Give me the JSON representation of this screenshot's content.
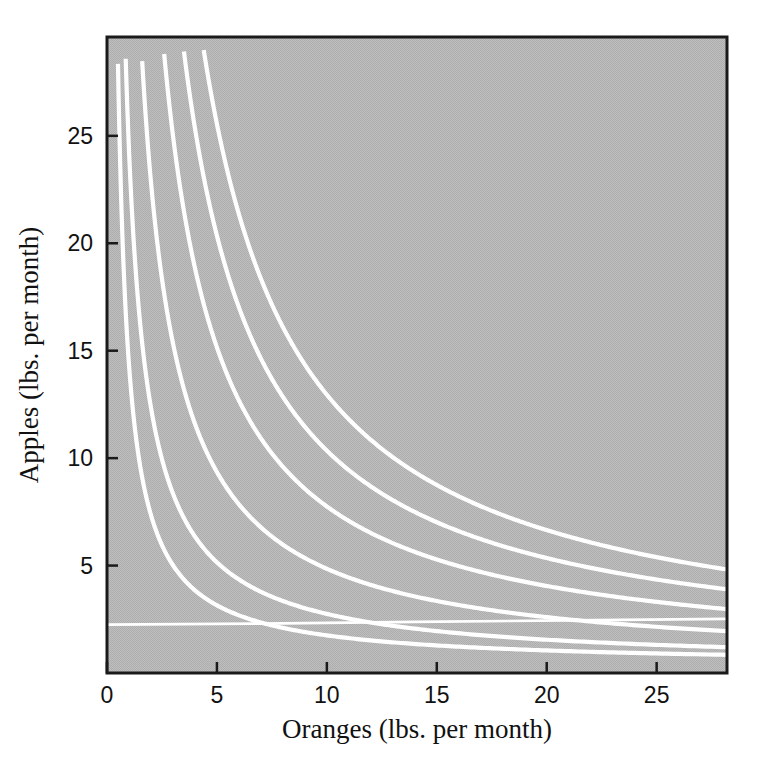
{
  "figure": {
    "background_color": "#ffffff",
    "plot_background_color": "#b6b6b6",
    "curve_color": "#ffffff",
    "axis_color": "#1a1a1a"
  },
  "chart_data": {
    "type": "line",
    "title": "",
    "subtitle": "",
    "xlabel": "Oranges (lbs. per month)",
    "ylabel": "Apples (lbs. per month)",
    "xlim": [
      0,
      28.2
    ],
    "ylim": [
      0,
      29.6
    ],
    "xticks": [
      0,
      5,
      10,
      15,
      20,
      25
    ],
    "xticklabels": [
      "0",
      "5",
      "10",
      "15",
      "20",
      "25"
    ],
    "yticks": [
      5,
      10,
      15,
      20,
      25
    ],
    "yticklabels": [
      "5",
      "10",
      "15",
      "20",
      "25"
    ],
    "grid": false,
    "legend": "none",
    "annotations": [],
    "series": [
      {
        "name": "indifference-curve-1",
        "k": 14.0,
        "asymptote": 0.35,
        "x_start": 0.5,
        "x_end": 28.2,
        "points": [
          [
            0.5,
            28.4
          ],
          [
            1.0,
            14.3
          ],
          [
            1.5,
            9.7
          ],
          [
            2.0,
            7.4
          ],
          [
            3.0,
            5.0
          ],
          [
            4.0,
            3.9
          ],
          [
            5.0,
            3.2
          ],
          [
            7.0,
            2.4
          ],
          [
            10.0,
            1.8
          ],
          [
            13.0,
            1.4
          ],
          [
            16.0,
            1.2
          ],
          [
            20.0,
            1.0
          ],
          [
            24.0,
            0.9
          ],
          [
            28.2,
            0.85
          ]
        ]
      },
      {
        "name": "indifference-curve-2",
        "k": 24.0,
        "asymptote": 0.35,
        "x_start": 0.85,
        "x_end": 28.2,
        "points": [
          [
            0.85,
            28.4
          ],
          [
            1.5,
            16.4
          ],
          [
            2.0,
            12.4
          ],
          [
            3.0,
            8.4
          ],
          [
            4.0,
            6.4
          ],
          [
            5.0,
            5.2
          ],
          [
            7.0,
            3.8
          ],
          [
            10.0,
            2.8
          ],
          [
            13.0,
            2.2
          ],
          [
            16.0,
            1.9
          ],
          [
            20.0,
            1.6
          ],
          [
            24.0,
            1.4
          ],
          [
            28.2,
            1.2
          ]
        ]
      },
      {
        "name": "indifference-curve-3",
        "k": 45.0,
        "asymptote": 0.35,
        "x_start": 1.6,
        "x_end": 28.2,
        "points": [
          [
            1.6,
            28.5
          ],
          [
            2.0,
            22.9
          ],
          [
            3.0,
            15.4
          ],
          [
            4.0,
            11.6
          ],
          [
            5.0,
            9.4
          ],
          [
            7.0,
            6.8
          ],
          [
            10.0,
            4.9
          ],
          [
            13.0,
            3.8
          ],
          [
            16.0,
            3.2
          ],
          [
            20.0,
            2.6
          ],
          [
            24.0,
            2.2
          ],
          [
            28.2,
            1.95
          ]
        ]
      },
      {
        "name": "indifference-curve-4",
        "k": 74.0,
        "asymptote": 0.35,
        "x_start": 2.6,
        "x_end": 28.2,
        "points": [
          [
            2.6,
            28.8
          ],
          [
            3.0,
            25.0
          ],
          [
            4.0,
            18.9
          ],
          [
            5.0,
            15.2
          ],
          [
            7.0,
            10.9
          ],
          [
            10.0,
            7.8
          ],
          [
            13.0,
            6.0
          ],
          [
            16.0,
            5.0
          ],
          [
            20.0,
            4.05
          ],
          [
            24.0,
            3.4
          ],
          [
            28.2,
            3.0
          ]
        ]
      },
      {
        "name": "indifference-curve-5",
        "k": 100.0,
        "asymptote": 0.35,
        "x_start": 3.5,
        "x_end": 28.2,
        "points": [
          [
            3.5,
            28.9
          ],
          [
            4.0,
            25.3
          ],
          [
            5.0,
            20.3
          ],
          [
            7.0,
            14.6
          ],
          [
            10.0,
            10.4
          ],
          [
            13.0,
            8.0
          ],
          [
            16.0,
            6.6
          ],
          [
            20.0,
            5.35
          ],
          [
            24.0,
            4.5
          ],
          [
            28.2,
            3.9
          ]
        ]
      },
      {
        "name": "indifference-curve-6",
        "k": 126.0,
        "asymptote": 0.35,
        "x_start": 4.4,
        "x_end": 28.2,
        "points": [
          [
            4.4,
            28.9
          ],
          [
            5.0,
            25.5
          ],
          [
            7.0,
            18.3
          ],
          [
            10.0,
            12.95
          ],
          [
            13.0,
            10.0
          ],
          [
            16.0,
            8.2
          ],
          [
            20.0,
            6.65
          ],
          [
            24.0,
            5.6
          ],
          [
            28.2,
            4.8
          ]
        ]
      },
      {
        "name": "budget-line-flat",
        "k": 0,
        "asymptote": 0,
        "x_start": 0.0,
        "x_end": 28.2,
        "points": [
          [
            0.0,
            2.25
          ],
          [
            7.0,
            2.3
          ],
          [
            14.0,
            2.38
          ],
          [
            21.0,
            2.45
          ],
          [
            28.2,
            2.52
          ]
        ]
      }
    ]
  }
}
